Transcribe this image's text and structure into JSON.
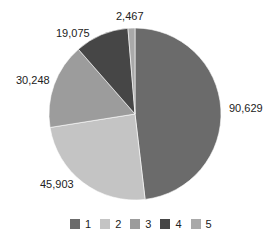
{
  "chart_data": {
    "type": "pie",
    "title": "",
    "categories": [
      "1",
      "2",
      "3",
      "4",
      "5"
    ],
    "values": [
      90629,
      45903,
      30248,
      19075,
      2467
    ],
    "labels": [
      "90,629",
      "45,903",
      "30,248",
      "19,075",
      "2,467"
    ],
    "colors": [
      "#6b6b6b",
      "#c4c4c4",
      "#9c9c9c",
      "#464646",
      "#a9a9a9"
    ],
    "start_angle": "12 o'clock",
    "direction": "clockwise",
    "legend_position": "bottom"
  },
  "legend": {
    "items": [
      {
        "label": "1",
        "color": "#6b6b6b"
      },
      {
        "label": "2",
        "color": "#c4c4c4"
      },
      {
        "label": "3",
        "color": "#9c9c9c"
      },
      {
        "label": "4",
        "color": "#464646"
      },
      {
        "label": "5",
        "color": "#a9a9a9"
      }
    ]
  },
  "data_labels": [
    {
      "text": "90,629",
      "x": 229,
      "y": 102
    },
    {
      "text": "45,903",
      "x": 40,
      "y": 178
    },
    {
      "text": "30,248",
      "x": 16,
      "y": 74
    },
    {
      "text": "19,075",
      "x": 56,
      "y": 27
    },
    {
      "text": "2,467",
      "x": 116,
      "y": 10
    }
  ]
}
